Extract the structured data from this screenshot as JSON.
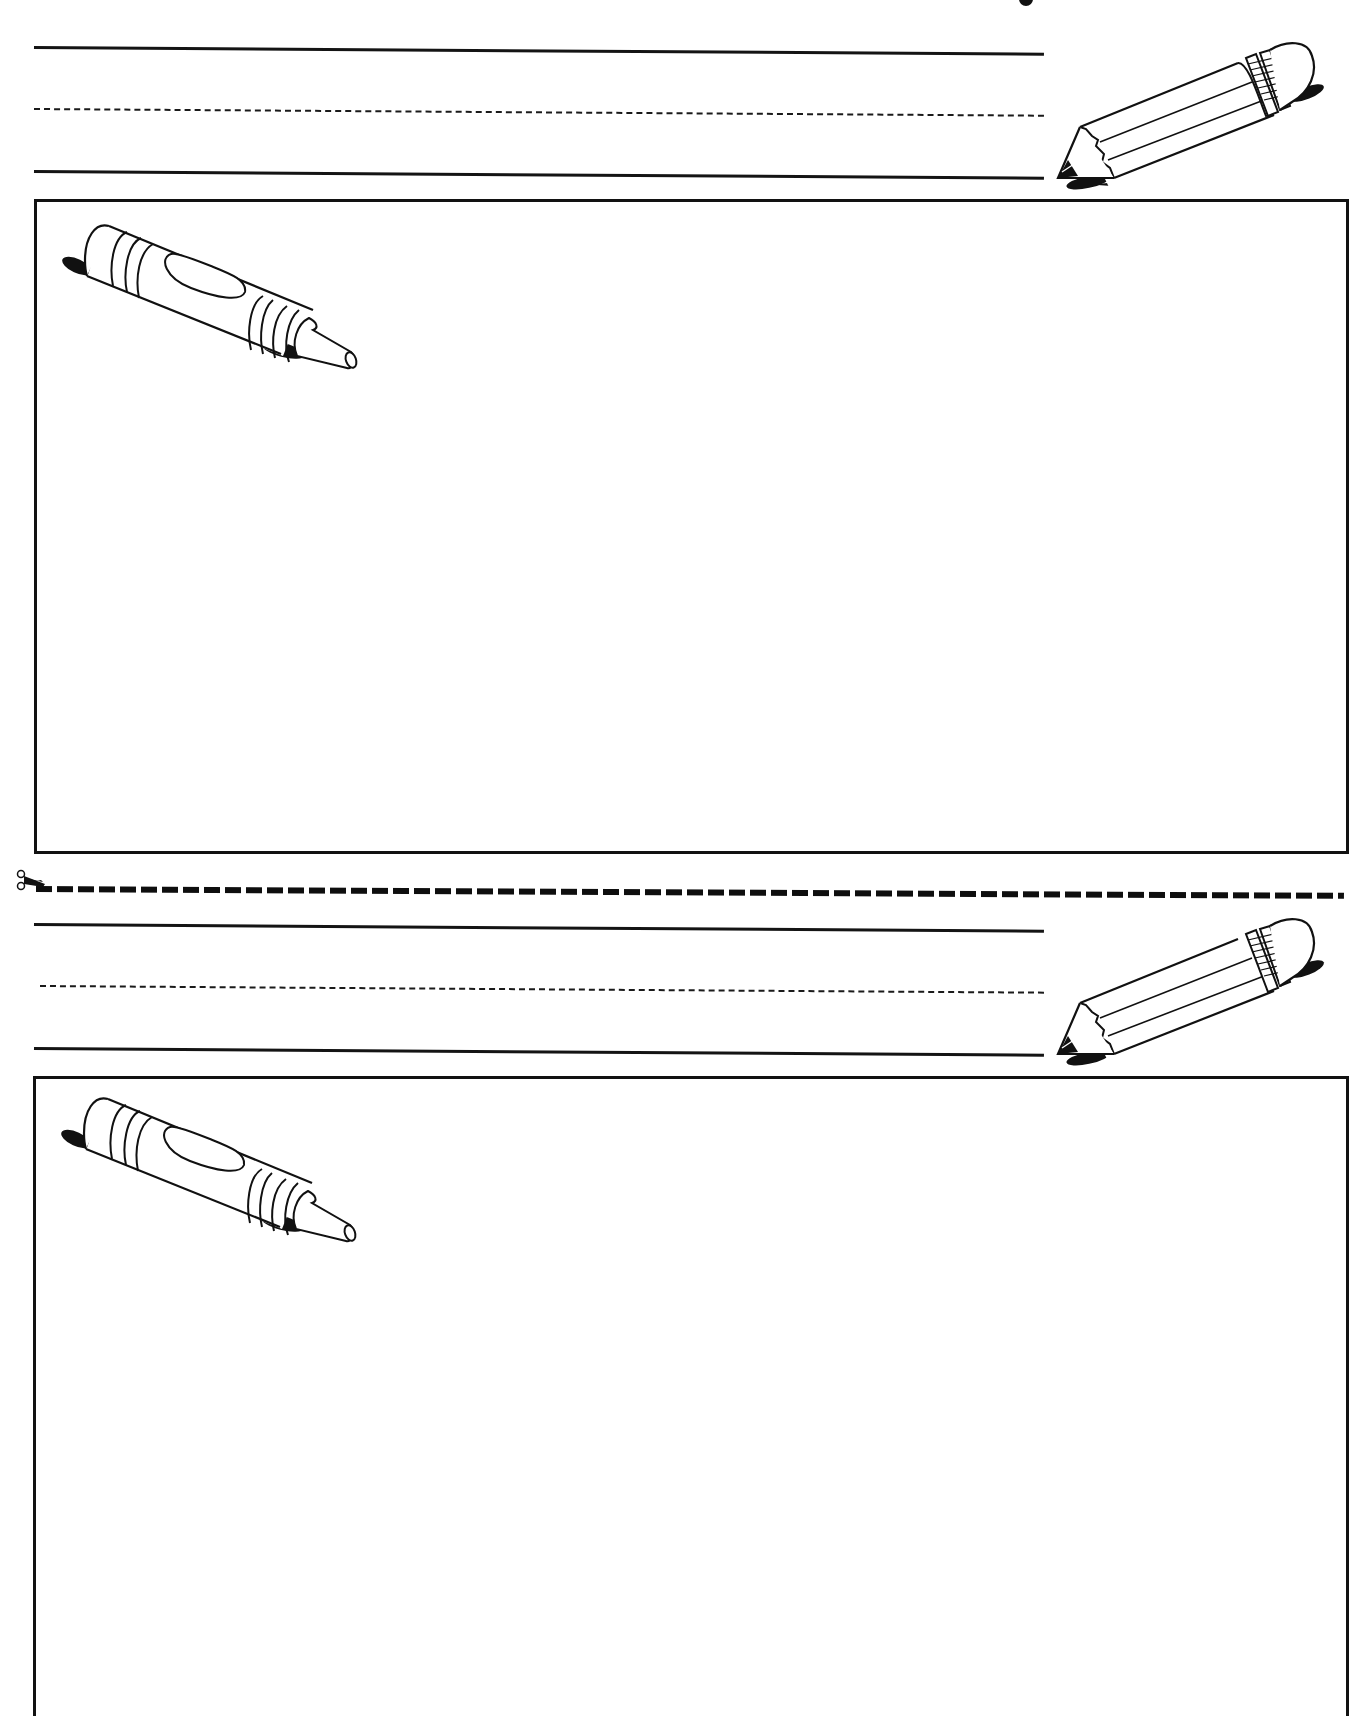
{
  "worksheet": {
    "type": "handwriting and drawing practice sheet",
    "colors": {
      "ink": "#141414",
      "paper": "#ffffff"
    },
    "sections": [
      {
        "id": "section-1",
        "writing_lines": {
          "top_solid": "solid-line",
          "middle": "dashed-midline",
          "bottom_solid": "baseline"
        },
        "decoration_icon": "pencil-icon",
        "drawing_box_icon": "crayon-icon",
        "drawing_box_content": ""
      },
      {
        "id": "section-2",
        "writing_lines": {
          "top_solid": "solid-line",
          "middle": "dashed-midline",
          "bottom_solid": "baseline"
        },
        "decoration_icon": "pencil-icon",
        "drawing_box_icon": "crayon-icon",
        "drawing_box_content": ""
      }
    ],
    "cut_line": {
      "icon": "scissors-icon",
      "style": "dashed"
    }
  }
}
